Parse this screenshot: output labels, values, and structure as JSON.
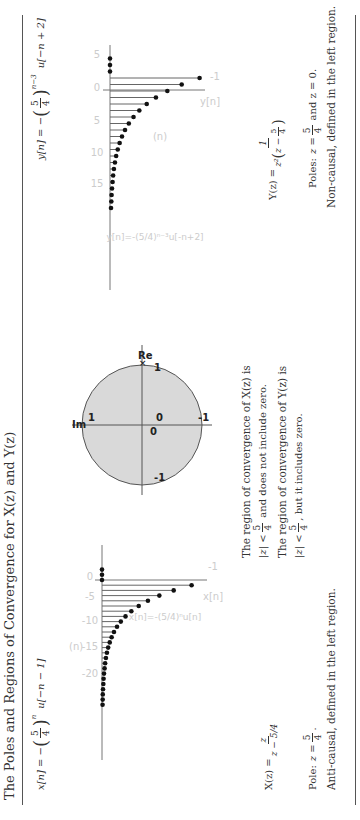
{
  "title": "The Poles and Regions of Convergence for X(z) and Y(z)",
  "x_panel": {
    "signal_lhs": "x[n] = −",
    "signal_frac_num": "5",
    "signal_frac_den": "4",
    "signal_exp": "n",
    "signal_rhs": "u[−n − 1]",
    "transform_lhs": "X(z) =",
    "transform_num": "z",
    "transform_den": "z − 5/4",
    "pole_text": "Pole: z = 5/4.",
    "pole_label": "Pole:",
    "pole_eq": "z =",
    "pole_num": "5",
    "pole_den": "4",
    "description": "Anti-causal, defined in the left region.",
    "plot_legend": "x[n]=-(5/4)ⁿu[n]",
    "axis_label_n": "(n)",
    "axis_label_x": "x[n]",
    "value_tick": "-1"
  },
  "roc_panel": {
    "axis_re": "Re",
    "axis_im": "Im",
    "tick_labels": [
      "1",
      "-1",
      "1",
      "-1",
      "0",
      "0"
    ],
    "roc_x_line1": "The region of convergence of X(z) is",
    "roc_x_ineq": "|z| <",
    "roc_x_frac_num": "5",
    "roc_x_frac_den": "4",
    "roc_x_line2_tail": "and does not include zero.",
    "roc_y_line1": "The region of convergence of Y(z) is",
    "roc_y_ineq": "|z| <",
    "roc_y_frac_num": "5",
    "roc_y_frac_den": "4",
    "roc_y_line2_tail": ", but it includes zero."
  },
  "y_panel": {
    "signal_lhs": "y[n] = −",
    "signal_frac_num": "5",
    "signal_frac_den": "4",
    "signal_exp": "n−3",
    "signal_rhs": "u[−n + 2]",
    "transform_lhs": "Y(z) =",
    "transform_num": "1",
    "transform_den_pre": "z²",
    "transform_den_inner": "z −",
    "transform_den_frac_num": "5",
    "transform_den_frac_den": "4",
    "poles_label": "Poles:",
    "poles_eq": "z =",
    "poles_num": "5",
    "poles_den": "4",
    "poles_tail": "and z = 0.",
    "description": "Non-causal, defined in the left region.",
    "plot_legend": "y[n]=-(5/4)ⁿ⁻³u[-n+2]",
    "axis_label_n": "(n)",
    "axis_label_y": "y[n]",
    "value_tick": "-1"
  },
  "chart_data": [
    {
      "type": "stem",
      "title": "x[n] = -(5/4)^n u[-n-1]",
      "xlabel": "(n)",
      "ylabel": "x[n]",
      "x_ticks": [
        0,
        -5,
        -10,
        -15,
        -20
      ],
      "n": [
        2,
        1,
        0,
        -1,
        -2,
        -3,
        -4,
        -5,
        -6,
        -7,
        -8,
        -9,
        -10,
        -11,
        -12,
        -13,
        -14,
        -15,
        -16,
        -17,
        -18,
        -19,
        -20,
        -21,
        -22,
        -23,
        -24
      ],
      "values": [
        0,
        0,
        0,
        -0.8,
        -0.64,
        -0.512,
        -0.41,
        -0.328,
        -0.262,
        -0.21,
        -0.168,
        -0.134,
        -0.107,
        -0.086,
        -0.069,
        -0.055,
        -0.044,
        -0.035,
        -0.028,
        -0.023,
        -0.018,
        -0.014,
        -0.012,
        -0.009,
        -0.007,
        -0.006,
        -0.005
      ],
      "y_ticks": [
        -1
      ]
    },
    {
      "type": "stem",
      "title": "y[n] = -(5/4)^(n-3) u[-n+2]",
      "xlabel": "(n)",
      "ylabel": "y[n]",
      "x_ticks": [
        5,
        0,
        -5,
        -10,
        -15
      ],
      "n": [
        5,
        4,
        3,
        2,
        1,
        0,
        -1,
        -2,
        -3,
        -4,
        -5,
        -6,
        -7,
        -8,
        -9,
        -10,
        -11,
        -12,
        -13,
        -14,
        -15,
        -16,
        -17,
        -18
      ],
      "values": [
        0,
        0,
        0,
        -0.8,
        -0.64,
        -0.512,
        -0.41,
        -0.328,
        -0.262,
        -0.21,
        -0.168,
        -0.134,
        -0.107,
        -0.086,
        -0.069,
        -0.055,
        -0.044,
        -0.035,
        -0.028,
        -0.023,
        -0.018,
        -0.014,
        -0.012,
        -0.009
      ],
      "y_ticks": [
        -1
      ]
    },
    {
      "type": "pole-zero",
      "title": "Region of convergence (unit circle)",
      "xlabel": "Re",
      "ylabel": "Im",
      "circle_radius": 1,
      "ticks": [
        -1,
        0,
        1
      ]
    }
  ]
}
